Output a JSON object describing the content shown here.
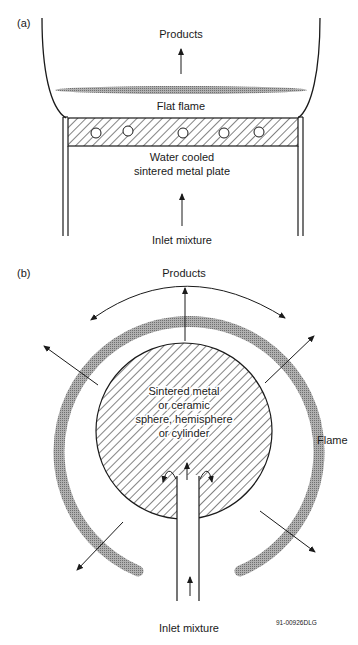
{
  "panel_a": {
    "label": "(a)",
    "products": "Products",
    "flame": "Flat flame",
    "plate_line1": "Water cooled",
    "plate_line2": "sintered metal plate",
    "inlet": "Inlet mixture"
  },
  "panel_b": {
    "label": "(b)",
    "products": "Products",
    "core_line1": "Sintered metal",
    "core_line2": "or ceramic",
    "core_line3": "sphere, hemisphere",
    "core_line4": "or cylinder",
    "flame": "Flame",
    "inlet": "Inlet mixture"
  },
  "figure_id": "91-00926DLG",
  "colors": {
    "ink": "#1a1a1a",
    "flame_gray": "#9a9a9a",
    "background": "#ffffff"
  }
}
